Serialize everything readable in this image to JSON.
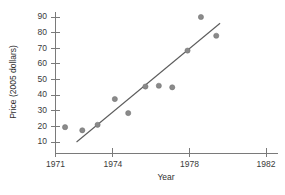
{
  "chart_data": {
    "type": "scatter",
    "title": "",
    "xlabel": "Year",
    "ylabel": "Price (2005 dollars)",
    "xlim": [
      1971,
      1982.6
    ],
    "ylim": [
      8,
      93
    ],
    "grid": false,
    "legend": "none",
    "x_ticks": [
      1971,
      1974,
      1978,
      1982
    ],
    "x_tick_labels": [
      "1971",
      "1974",
      "1978",
      "1982"
    ],
    "x_minor_ticks": [],
    "y_ticks": [
      10,
      20,
      30,
      40,
      50,
      60,
      70,
      80,
      90
    ],
    "y_tick_labels": [
      "10",
      "20",
      "30",
      "40",
      "50",
      "60",
      "70",
      "80",
      "90"
    ],
    "series": [
      {
        "name": "Price observations",
        "type": "scatter",
        "marker": "circle",
        "color": "#8a8a8a",
        "points": [
          {
            "x": 1971.5,
            "y": 19.5
          },
          {
            "x": 1972.4,
            "y": 17.5
          },
          {
            "x": 1973.2,
            "y": 21.0
          },
          {
            "x": 1974.1,
            "y": 37.5
          },
          {
            "x": 1974.8,
            "y": 28.5
          },
          {
            "x": 1975.7,
            "y": 45.5
          },
          {
            "x": 1976.4,
            "y": 46.0
          },
          {
            "x": 1977.1,
            "y": 45.0
          },
          {
            "x": 1977.9,
            "y": 68.5
          },
          {
            "x": 1978.6,
            "y": 90.0
          },
          {
            "x": 1979.4,
            "y": 78.0
          }
        ]
      },
      {
        "name": "Least-squares fit line",
        "type": "line",
        "color": "#5c5c5c",
        "endpoints": [
          {
            "x": 1972.1,
            "y": 10.0
          },
          {
            "x": 1979.6,
            "y": 86.0
          }
        ]
      }
    ]
  },
  "axes": {
    "x_title": "Year",
    "y_title": "Price (2005 dollars)"
  }
}
